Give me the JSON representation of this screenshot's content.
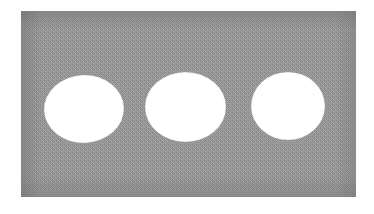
{
  "document": {
    "title": "Grayscale figure: three white ellipses on a dithered gray panel",
    "width": 374,
    "height": 214,
    "page_background": "#fefefe",
    "rendering": "halftone-dither-bitmap"
  },
  "figure": {
    "caption": "",
    "panel": {
      "label": "gray-panel",
      "x": 21,
      "y": 11,
      "width": 335,
      "height": 186,
      "fill": "#8a8a8a",
      "dither_light": "#a9a9a9",
      "dither_dark": "#6e6e6e",
      "edge_shadow": "#767676",
      "border": "none"
    },
    "shapes": [
      {
        "label": "ellipse-left",
        "index": 1,
        "cx": 84,
        "cy": 109,
        "rx": 40,
        "ry": 34,
        "fill": "#ffffff",
        "rotation": -2
      },
      {
        "label": "ellipse-middle",
        "index": 2,
        "cx": 185.5,
        "cy": 107,
        "rx": 40.5,
        "ry": 35,
        "fill": "#ffffff",
        "rotation": 0
      },
      {
        "label": "ellipse-right",
        "index": 3,
        "cx": 288,
        "cy": 106,
        "rx": 37,
        "ry": 34,
        "fill": "#ffffff",
        "rotation": 0
      }
    ],
    "shape_count": 3,
    "shape_fill_color": "#ffffff",
    "background_fill_color": "#8a8a8a"
  }
}
